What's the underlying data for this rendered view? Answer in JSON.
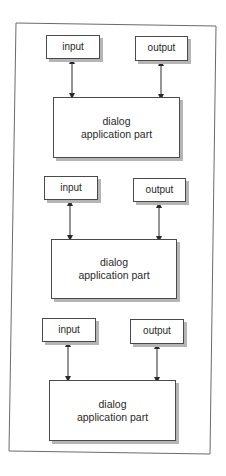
{
  "diagram": {
    "type": "architecture",
    "colors": {
      "border": "#4a4a4a",
      "shadow": "#b5b5b5",
      "background": "#ffffff"
    },
    "sections": [
      {
        "input_label": "input",
        "output_label": "output",
        "main_line1": "dialog",
        "main_line2": "application part"
      },
      {
        "input_label": "input",
        "output_label": "output",
        "main_line1": "dialog",
        "main_line2": "application part"
      },
      {
        "input_label": "input",
        "output_label": "output",
        "main_line1": "dialog",
        "main_line2": "application part"
      }
    ],
    "connections": [
      {
        "from": "input",
        "to": "dialog application part",
        "type": "bidirectional"
      },
      {
        "from": "output",
        "to": "dialog application part",
        "type": "bidirectional"
      }
    ]
  }
}
